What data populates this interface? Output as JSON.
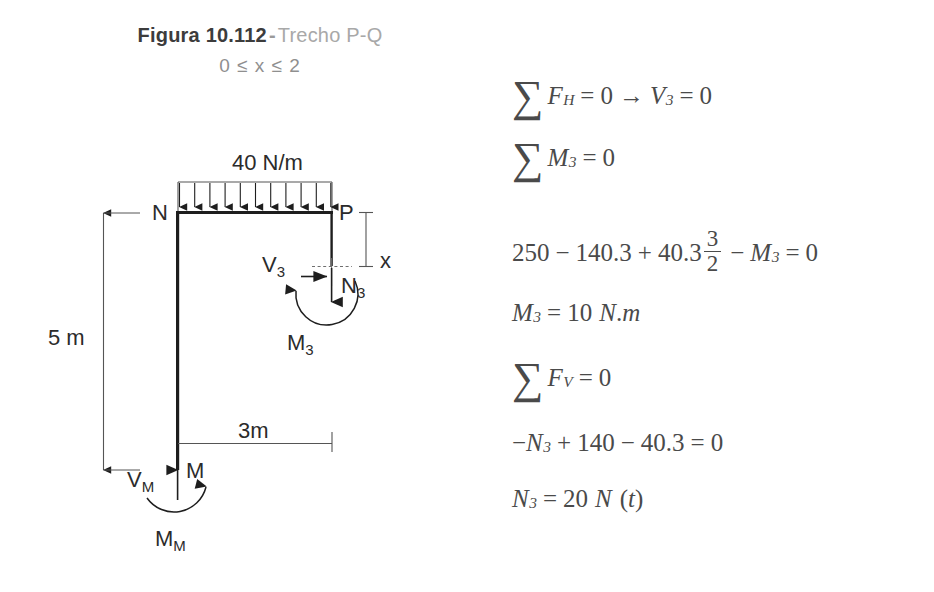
{
  "figure": {
    "label": "Figura 10.112",
    "dash": "-",
    "subtitle": "Trecho P-Q",
    "range": "0 ≤ x ≤ 2"
  },
  "diagram": {
    "load_label": "40 N/m",
    "node_n": "N",
    "node_p": "P",
    "node_m": "M",
    "height_dim": "5 m",
    "span_dim": "3m",
    "cut_dim": "x",
    "shear_cut": "V",
    "shear_cut_sub": "3",
    "normal_cut": "N",
    "normal_cut_sub": "3",
    "moment_cut": "M",
    "moment_cut_sub": "3",
    "base_shear": "V",
    "base_shear_sub": "M",
    "base_moment": "M",
    "base_moment_sub": "M",
    "load_arrow_count": 11,
    "line_color": "#1e1e1e",
    "dim_color": "#555555"
  },
  "equations": [
    {
      "id": "sum-fh",
      "sigma": "∑",
      "parts": [
        {
          "t": "F",
          "k": "it"
        },
        {
          "t": "H",
          "k": "sub"
        },
        {
          "t": "=",
          "k": "op"
        },
        {
          "t": "0",
          "k": "n"
        },
        {
          "t": "→",
          "k": "op"
        },
        {
          "t": "V",
          "k": "it"
        },
        {
          "t": "3",
          "k": "sub"
        },
        {
          "t": "=",
          "k": "op"
        },
        {
          "t": "0",
          "k": "n"
        }
      ]
    },
    {
      "id": "sum-m3",
      "sigma": "∑",
      "parts": [
        {
          "t": "M",
          "k": "it"
        },
        {
          "t": "3",
          "k": "sub"
        },
        {
          "t": "=",
          "k": "op"
        },
        {
          "t": "0",
          "k": "n"
        }
      ]
    },
    {
      "id": "moment-balance",
      "sigma": "",
      "parts": [
        {
          "t": "250",
          "k": "n"
        },
        {
          "t": "−",
          "k": "op"
        },
        {
          "t": "140.3",
          "k": "n"
        },
        {
          "t": "+",
          "k": "op"
        },
        {
          "t": "40.3",
          "k": "n"
        },
        {
          "t": "3/2",
          "k": "frac"
        },
        {
          "t": "−",
          "k": "op"
        },
        {
          "t": "M",
          "k": "it"
        },
        {
          "t": "3",
          "k": "sub"
        },
        {
          "t": "=",
          "k": "op"
        },
        {
          "t": "0",
          "k": "n"
        }
      ]
    },
    {
      "id": "m3-result",
      "sigma": "",
      "parts": [
        {
          "t": "M",
          "k": "it"
        },
        {
          "t": "3",
          "k": "sub"
        },
        {
          "t": "=",
          "k": "op2"
        },
        {
          "t": "10",
          "k": "n"
        },
        {
          "t": "N",
          "k": "itsp"
        },
        {
          "t": ".",
          "k": "n"
        },
        {
          "t": "m",
          "k": "it"
        }
      ]
    },
    {
      "id": "sum-fv",
      "sigma": "∑",
      "parts": [
        {
          "t": "F",
          "k": "it"
        },
        {
          "t": "V",
          "k": "sub"
        },
        {
          "t": "=",
          "k": "op"
        },
        {
          "t": "0",
          "k": "n"
        }
      ]
    },
    {
      "id": "vertical-balance",
      "sigma": "",
      "parts": [
        {
          "t": "−",
          "k": "n"
        },
        {
          "t": "N",
          "k": "it"
        },
        {
          "t": "3",
          "k": "sub"
        },
        {
          "t": "+",
          "k": "op"
        },
        {
          "t": "140",
          "k": "n"
        },
        {
          "t": "−",
          "k": "op"
        },
        {
          "t": "40.3",
          "k": "n"
        },
        {
          "t": "=",
          "k": "op"
        },
        {
          "t": "0",
          "k": "n"
        }
      ]
    },
    {
      "id": "n3-result",
      "sigma": "",
      "parts": [
        {
          "t": "N",
          "k": "it"
        },
        {
          "t": "3",
          "k": "sub"
        },
        {
          "t": "=",
          "k": "op2"
        },
        {
          "t": "20",
          "k": "n"
        },
        {
          "t": "N",
          "k": "itsp"
        },
        {
          "t": "(",
          "k": "nsp"
        },
        {
          "t": "t",
          "k": "it"
        },
        {
          "t": ")",
          "k": "n"
        }
      ]
    }
  ]
}
